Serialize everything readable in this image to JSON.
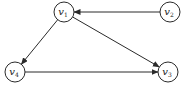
{
  "diagram": {
    "type": "directed-graph",
    "nodes": [
      {
        "id": "v1",
        "base": "v",
        "sub": "1",
        "x": 64,
        "y": 12,
        "r": 10
      },
      {
        "id": "v2",
        "base": "v",
        "sub": "2",
        "x": 170,
        "y": 12,
        "r": 10
      },
      {
        "id": "v3",
        "base": "v",
        "sub": "3",
        "x": 168,
        "y": 72,
        "r": 10
      },
      {
        "id": "v4",
        "base": "v",
        "sub": "4",
        "x": 15,
        "y": 72,
        "r": 10
      }
    ],
    "edges": [
      {
        "from": "v2",
        "to": "v1"
      },
      {
        "from": "v1",
        "to": "v4"
      },
      {
        "from": "v1",
        "to": "v3"
      },
      {
        "from": "v4",
        "to": "v3"
      }
    ],
    "colors": {
      "stroke": "#2a2a2a",
      "background": "#ffffff"
    }
  }
}
